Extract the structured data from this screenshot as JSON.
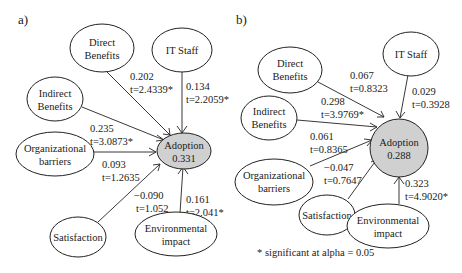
{
  "footnote": "* significant at alpha = 0.05",
  "panels": [
    {
      "id": "a",
      "label": "a)",
      "target": {
        "line1": "Adoption",
        "line2": "0.331"
      },
      "nodes": {
        "direct_benefits": {
          "line1": "Direct",
          "line2": "Benefits"
        },
        "it_staff": {
          "line1": "IT Staff"
        },
        "indirect_benefits": {
          "line1": "Indirect",
          "line2": "Benefits"
        },
        "org_barriers": {
          "line1": "Organizational",
          "line2": "barriers"
        },
        "satisfaction": {
          "line1": "Satisfaction"
        },
        "env_impact": {
          "line1": "Environmental",
          "line2": "impact"
        }
      },
      "edges": {
        "direct_benefits": {
          "coef": "0.202",
          "t": "t=2.4339*"
        },
        "it_staff": {
          "coef": "0.134",
          "t": "t=2.2059*"
        },
        "indirect_benefits": {
          "coef": "0.235",
          "t": "t=3.0873*"
        },
        "org_barriers": {
          "coef": "0.093",
          "t": "t=1.2635"
        },
        "satisfaction": {
          "coef": "−0.090",
          "t": "t=1.052"
        },
        "env_impact": {
          "coef": "0.161",
          "t": "t=2.041*"
        }
      }
    },
    {
      "id": "b",
      "label": "b)",
      "target": {
        "line1": "Adoption",
        "line2": "0.288"
      },
      "nodes": {
        "direct_benefits": {
          "line1": "Direct",
          "line2": "Benefits"
        },
        "it_staff": {
          "line1": "IT Staff"
        },
        "indirect_benefits": {
          "line1": "Indirect",
          "line2": "Benefits"
        },
        "org_barriers": {
          "line1": "Organizational",
          "line2": "barriers"
        },
        "satisfaction": {
          "line1": "Satisfaction"
        },
        "env_impact": {
          "line1": "Environmental",
          "line2": "impact"
        }
      },
      "edges": {
        "direct_benefits": {
          "coef": "0.067",
          "t": "t=0.8323"
        },
        "it_staff": {
          "coef": "0.029",
          "t": "t=0.3928"
        },
        "indirect_benefits": {
          "coef": "0.298",
          "t": "t=3.9769*"
        },
        "org_barriers": {
          "coef": "0.061",
          "t": "t=0.8365"
        },
        "satisfaction": {
          "coef": "−0.047",
          "t": "t=0.7647"
        },
        "env_impact": {
          "coef": "0.323",
          "t": "t=4.9020*"
        }
      }
    }
  ]
}
